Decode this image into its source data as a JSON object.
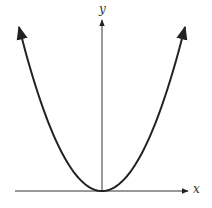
{
  "chart_data": {
    "type": "line",
    "title": "",
    "xlabel": "x",
    "ylabel": "y",
    "function": "y = x^2",
    "series": [
      {
        "name": "parabola",
        "x": [
          -4,
          -3,
          -2,
          -1,
          0,
          1,
          2,
          3,
          4
        ],
        "values": [
          16,
          9,
          4,
          1,
          0,
          1,
          4,
          9,
          16
        ]
      }
    ],
    "grid": false,
    "legend": "none",
    "curve_arrows": true,
    "axis_arrows": true,
    "ticks": "none"
  },
  "axes": {
    "x_label": "x",
    "y_label": "y"
  },
  "colors": {
    "curve": "#222222",
    "axes": "#333333",
    "background": "#ffffff"
  }
}
